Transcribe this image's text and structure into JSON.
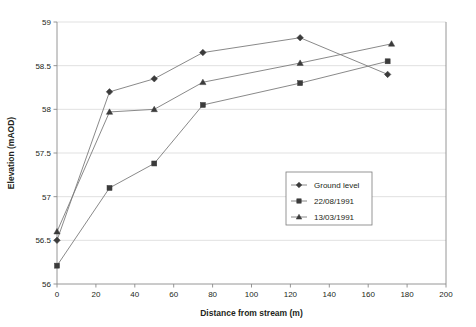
{
  "chart_data": {
    "type": "line",
    "title": "",
    "xlabel": "Distance from stream (m)",
    "ylabel": "Elevation (mAOD)",
    "xlim": [
      0,
      200
    ],
    "ylim": [
      56,
      59
    ],
    "xticks": [
      0,
      20,
      40,
      60,
      80,
      100,
      120,
      140,
      160,
      180,
      200
    ],
    "xtick_labels": [
      "0",
      "20",
      "40",
      "60",
      "80",
      "100",
      "120",
      "140",
      "160",
      "180",
      "200"
    ],
    "yticks": [
      56,
      56.5,
      57,
      57.5,
      58,
      58.5,
      59
    ],
    "ytick_labels": [
      "56",
      "56.5",
      "57",
      "57.5",
      "58",
      "58.5",
      "59"
    ],
    "grid": "horizontal",
    "legend_position": "inside-right-lower",
    "series": [
      {
        "name": "Ground level",
        "marker": "diamond",
        "x": [
          0,
          27,
          50,
          75,
          125,
          170
        ],
        "y": [
          56.5,
          58.2,
          58.35,
          58.65,
          58.82,
          58.4
        ]
      },
      {
        "name": "22/08/1991",
        "marker": "square",
        "x": [
          0,
          27,
          50,
          75,
          125,
          170
        ],
        "y": [
          56.21,
          57.1,
          57.38,
          58.05,
          58.3,
          58.55
        ]
      },
      {
        "name": "13/03/1991",
        "marker": "triangle",
        "x": [
          0,
          27,
          50,
          75,
          125,
          172
        ],
        "y": [
          56.6,
          57.97,
          58.0,
          58.31,
          58.53,
          58.75
        ]
      }
    ]
  },
  "legend": {
    "entries": [
      {
        "label": "Ground level",
        "marker": "diamond"
      },
      {
        "label": "22/08/1991",
        "marker": "square"
      },
      {
        "label": "13/03/1991",
        "marker": "triangle"
      }
    ]
  }
}
